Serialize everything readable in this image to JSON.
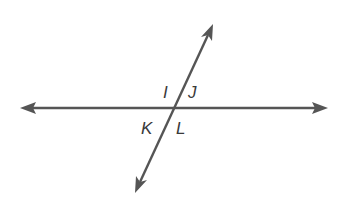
{
  "diagram": {
    "type": "intersecting-lines",
    "colors": {
      "line": "#555555",
      "label": "#3a3a3a",
      "background": "#ffffff"
    },
    "horizontal_line": {
      "x1": 20,
      "y1": 108,
      "x2": 327,
      "y2": 108,
      "arrows": "both"
    },
    "transversal": {
      "x1": 213,
      "y1": 24,
      "x2": 135,
      "y2": 193,
      "arrows": "both"
    },
    "intersection": {
      "x": 174,
      "y": 108
    },
    "labels": [
      {
        "text": "I",
        "x": 163,
        "y": 98,
        "position": "upper-left angle"
      },
      {
        "text": "J",
        "x": 188,
        "y": 98,
        "position": "upper-right angle"
      },
      {
        "text": "K",
        "x": 142,
        "y": 133,
        "position": "lower-left angle"
      },
      {
        "text": "L",
        "x": 176,
        "y": 133,
        "position": "lower-right angle"
      }
    ]
  }
}
